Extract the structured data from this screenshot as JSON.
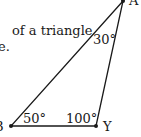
{
  "text": {
    "line1": "of a triangle",
    "line2": "e."
  },
  "diagram": {
    "vertices": {
      "A": {
        "label": "A",
        "x": 123,
        "y": 1
      },
      "B": {
        "label": "B",
        "x": 11,
        "y": 126
      },
      "Y": {
        "label": "Y",
        "x": 96,
        "y": 126
      }
    },
    "angles": {
      "A": "30°",
      "B": "50°",
      "Y": "100°"
    },
    "stroke_color": "#1a1a1a"
  }
}
